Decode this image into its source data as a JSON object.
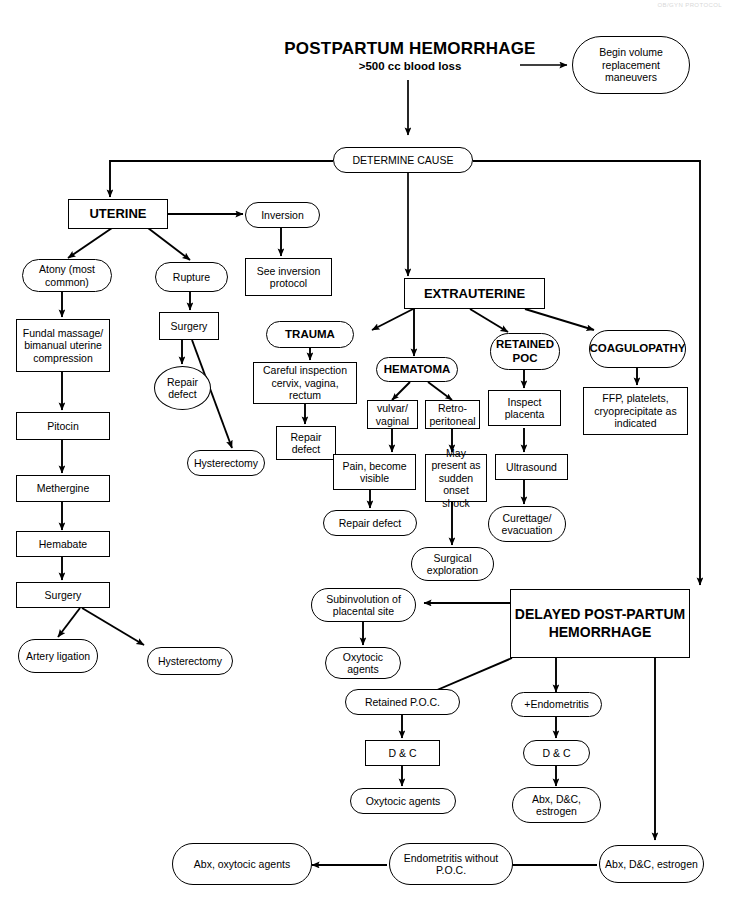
{
  "document": {
    "title_main": "POSTPARTUM HEMORRHAGE",
    "title_sub": ">500 cc blood loss",
    "header_faint": "OB/GYN PROTOCOL"
  },
  "nodes": {
    "begin_volume": "Begin volume replacement maneuvers",
    "determine_cause": "DETERMINE CAUSE",
    "uterine": "UTERINE",
    "inversion": "Inversion",
    "see_inversion_protocol": "See inversion protocol",
    "atony": "Atony (most common)",
    "rupture": "Rupture",
    "fundal_massage": "Fundal massage/ bimanual uterine compression",
    "surgery_rupture": "Surgery",
    "repair_defect_rupture": "Repair defect",
    "pitocin": "Pitocin",
    "methergine": "Methergine",
    "hemabate": "Hemabate",
    "surgery_atony": "Surgery",
    "hysterectomy_rupture": "Hysterectomy",
    "artery_ligation": "Artery ligation",
    "hysterectomy_atony": "Hysterectomy",
    "extrauterine": "EXTRAUTERINE",
    "trauma": "TRAUMA",
    "hematoma": "HEMATOMA",
    "retained_poc": "RETAINED POC",
    "coagulopathy": "COAGULOPATHY",
    "careful_inspection": "Careful inspection cervix, vagina, rectum",
    "repair_defect_trauma": "Repair defect",
    "vulvar_vaginal": "vulvar/ vaginal",
    "retroperitoneal": "Retro- peritoneal",
    "pain_visible": "Pain, become visible",
    "may_present_shock": "May present as sudden onset shock",
    "repair_defect_hematoma": "Repair defect",
    "surgical_exploration": "Surgical exploration",
    "inspect_placenta": "Inspect placenta",
    "ultrasound": "Ultrasound",
    "curettage_evacuation": "Curettage/ evacuation",
    "ffp_platelets": "FFP, platelets, cryoprecipitate as indicated",
    "delayed_pph": "DELAYED POST-PARTUM HEMORRHAGE",
    "subinvolution": "Subinvolution of placental site",
    "oxytocic_agents_sub": "Oxytocic agents",
    "retained_poc_delayed": "Retained P.O.C.",
    "dc_poc": "D & C",
    "oxytocic_agents_poc": "Oxytocic agents",
    "endometritis_plus": "+Endometritis",
    "dc_endo": "D & C",
    "abx_dc_estrogen_endo": "Abx, D&C, estrogen",
    "abx_dc_estrogen_right": "Abx, D&C, estrogen",
    "endometritis_without_poc": "Endometritis without P.O.C.",
    "abx_oxytocic_agents": "Abx, oxytocic agents"
  },
  "colors": {
    "stroke": "#000000",
    "background": "#ffffff",
    "text": "#000000"
  }
}
